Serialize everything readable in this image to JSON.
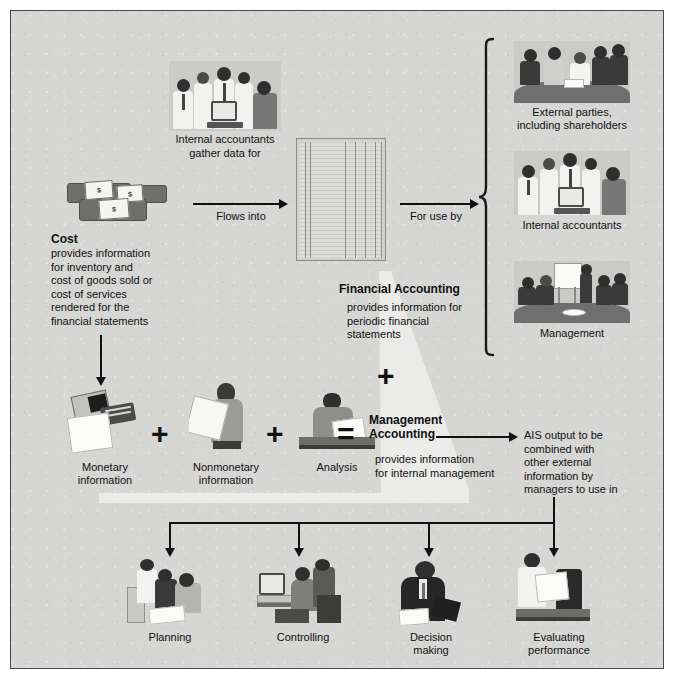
{
  "diagram": {
    "background_color": "#d6d6d4",
    "border_color": "#4a4a4a"
  },
  "top_flow": {
    "source_caption": "Internal accountants\ngather data for",
    "flow_label": "Flows into",
    "use_label": "For use by"
  },
  "cost": {
    "heading": "Cost",
    "body": "provides information\nfor inventory and\ncost of goods sold or\ncost of services\nrendered for the\nfinancial statements"
  },
  "users": [
    {
      "caption": "External parties,\nincluding shareholders",
      "icon": "meeting-table-icon"
    },
    {
      "caption": "Internal accountants",
      "icon": "accountants-group-icon"
    },
    {
      "caption": "Management",
      "icon": "boardroom-presentation-icon"
    }
  ],
  "financial_accounting": {
    "heading": "Financial Accounting",
    "body": "provides information for\nperiodic financial\nstatements"
  },
  "operator_plus": "+",
  "operator_equals": "=",
  "inputs": [
    {
      "caption": "Monetary\ninformation",
      "icon": "printer-report-icon"
    },
    {
      "caption": "Nonmonetary\ninformation",
      "icon": "person-reading-paper-icon"
    },
    {
      "caption": "Analysis",
      "icon": "person-at-desk-icon"
    }
  ],
  "input_operators": [
    "+",
    "+"
  ],
  "management_accounting": {
    "heading": "Management\nAccounting",
    "body": "provides information\nfor internal management"
  },
  "ais_output": {
    "text": "AIS output to be\ncombined with\nother external\ninformation by\nmanagers to use in"
  },
  "outcomes": [
    {
      "caption": "Planning",
      "icon": "team-planning-icon"
    },
    {
      "caption": "Controlling",
      "icon": "computer-controlling-icon"
    },
    {
      "caption": "Decision\nmaking",
      "icon": "executive-reading-icon"
    },
    {
      "caption": "Evaluating\nperformance",
      "icon": "two-people-review-icon"
    }
  ]
}
